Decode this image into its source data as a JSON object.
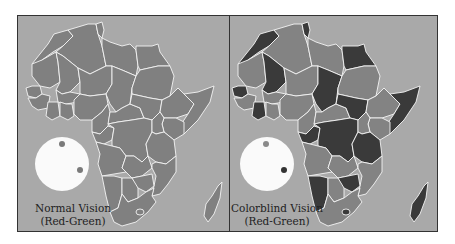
{
  "panels": [
    {
      "id": "normal",
      "caption_line1": "Normal Vision",
      "caption_line2": "(Red-Green)",
      "background_color": "#a9a9a9",
      "land_color": "#808080",
      "highlight_color": "#808080",
      "dot_colors": [
        "#7a7a7a",
        "#7a7a7a"
      ]
    },
    {
      "id": "colorblind",
      "caption_line1": "Colorblind Vision",
      "caption_line2": "(Red-Green)",
      "background_color": "#a9a9a9",
      "land_color": "#838383",
      "highlight_color": "#3a3a3a",
      "dot_colors": [
        "#8a8a8a",
        "#333333"
      ]
    }
  ],
  "colors": {
    "border": "#f4f4f4",
    "frame": "#333333",
    "disc": "#fafafa"
  }
}
